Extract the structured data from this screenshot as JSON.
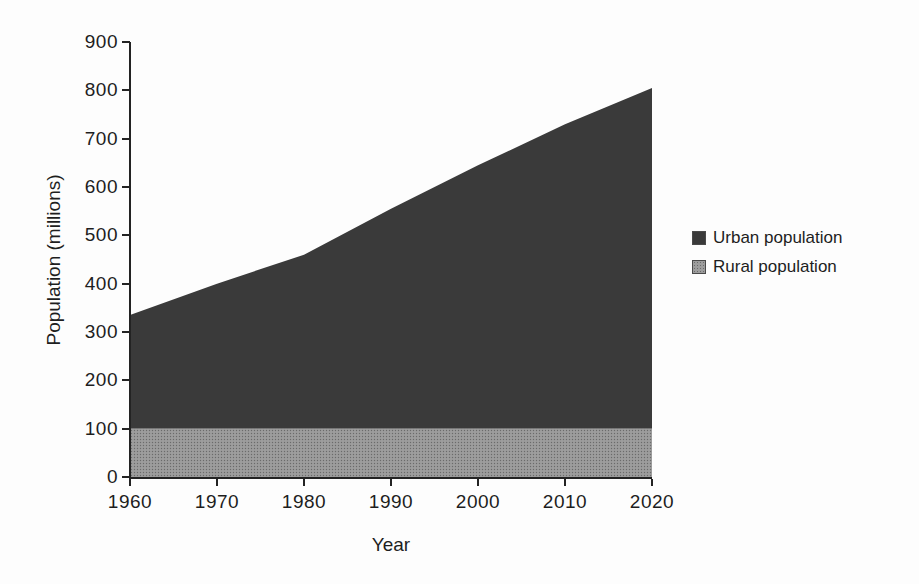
{
  "chart_data": {
    "type": "area",
    "stacked": true,
    "title": "",
    "xlabel": "Year",
    "ylabel": "Population (millions)",
    "x": [
      1960,
      1970,
      1980,
      1990,
      2000,
      2010,
      2020
    ],
    "x_tick_labels": [
      "1960",
      "1970",
      "1980",
      "1990",
      "2000",
      "2010",
      "2020"
    ],
    "y_ticks": [
      0,
      100,
      200,
      300,
      400,
      500,
      600,
      700,
      800,
      900
    ],
    "y_tick_labels": [
      "0",
      "100",
      "200",
      "300",
      "400",
      "500",
      "600",
      "700",
      "800",
      "900"
    ],
    "ylim": [
      0,
      900
    ],
    "grid": false,
    "legend_position": "right",
    "series": [
      {
        "name": "Rural population",
        "values": [
          100,
          100,
          100,
          100,
          100,
          100,
          100
        ],
        "color": "#8f8f8f"
      },
      {
        "name": "Urban population",
        "values": [
          235,
          300,
          360,
          455,
          545,
          630,
          705
        ],
        "color": "#3a3a3a"
      }
    ],
    "stacked_totals": [
      335,
      400,
      460,
      555,
      645,
      730,
      805
    ]
  },
  "legend": {
    "items": [
      {
        "label": "Urban population",
        "color": "#3a3a3a"
      },
      {
        "label": "Rural population",
        "color": "#8f8f8f"
      }
    ]
  },
  "colors": {
    "axis": "#232323",
    "rural_halftone_base": "#9d9d9d",
    "rural_halftone_dot": "#6b6b6b"
  }
}
